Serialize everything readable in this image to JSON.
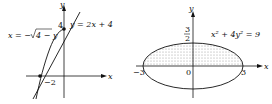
{
  "figures": [
    {
      "name": "region-between-line-and-parabola",
      "axis_x_label": "x",
      "axis_y_label": "y",
      "curve1_label": "y = 2x + 4",
      "curve2_label": "x = −√4 − y",
      "curve2_prefix": "x = −",
      "curve2_radicand": "4 − y",
      "y_intercept_label": "4",
      "x_intercept_label": "−2"
    },
    {
      "name": "ellipse-upper-half-shaded",
      "axis_x_label": "x",
      "axis_y_label": "y",
      "equation_label": "x² + 4y² = 9",
      "top_label_num": "3",
      "top_label_den": "2",
      "left_label": "−3",
      "right_label": "3",
      "origin_label": "0"
    }
  ],
  "colors": {
    "ink": "#111111",
    "shade": "#c8c8c8"
  }
}
